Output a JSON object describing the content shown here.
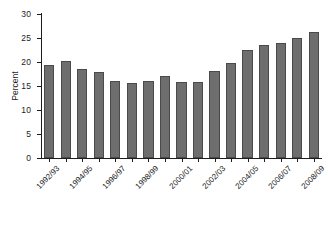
{
  "chart_data": {
    "type": "bar",
    "title": "",
    "xlabel": "",
    "ylabel": "Percent",
    "ylim": [
      0,
      30
    ],
    "yticks": [
      0,
      5,
      10,
      15,
      20,
      25,
      30
    ],
    "ytick_labels": [
      "0",
      "5",
      "10",
      "15",
      "20",
      "25",
      "30"
    ],
    "grid": false,
    "legend": false,
    "bar_color": "#6e6e6e",
    "bar_edge_color": "#4a4a4a",
    "axis_color": "#1d1d1d",
    "categories": [
      "1992/93",
      "1993/94",
      "1994/95",
      "1995/96",
      "1996/97",
      "1997/98",
      "1998/99",
      "1999/2000",
      "2000/01",
      "2001/02",
      "2002/03",
      "2003/04",
      "2004/05",
      "2005/06",
      "2006/07",
      "2007/08",
      "2008/09"
    ],
    "visible_tick_labels": [
      "1992/93",
      "1994/95",
      "1996/97",
      "1998/99",
      "2000/01",
      "2002/03",
      "2004/05",
      "2006/07",
      "2008/09"
    ],
    "visible_tick_indices": [
      0,
      2,
      4,
      6,
      8,
      10,
      12,
      14,
      16
    ],
    "values": [
      19.4,
      20.3,
      18.6,
      18.0,
      16.1,
      15.7,
      16.0,
      17.1,
      15.8,
      15.8,
      18.2,
      19.7,
      22.4,
      23.6,
      23.9,
      24.9,
      26.2
    ]
  }
}
